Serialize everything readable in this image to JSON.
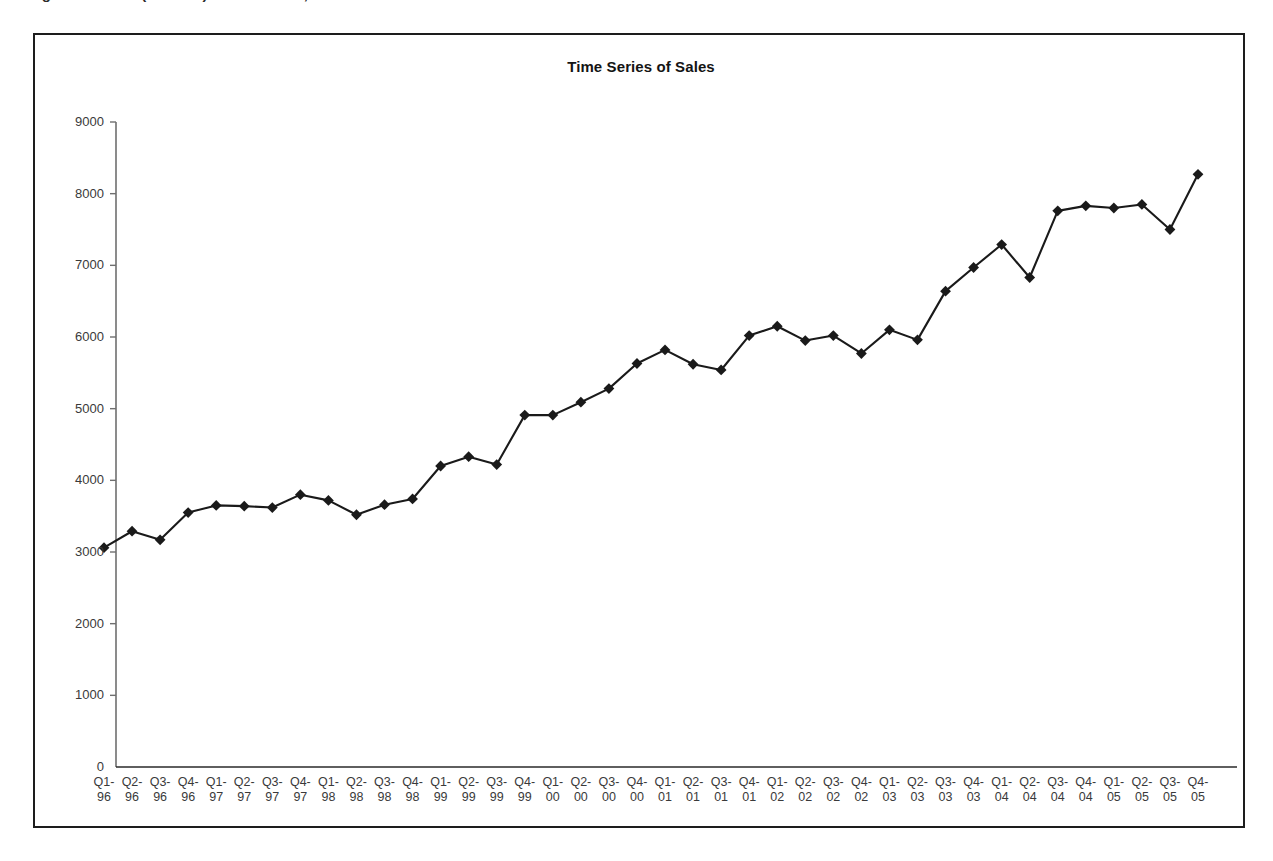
{
  "caption": {
    "text": "Figure 1. Sales (in 000’s) of Product X, Annual Sales",
    "visible_fragment": "partially cropped heading above figure"
  },
  "figure": {
    "border_color": "#1d1d1d"
  },
  "chart_data": {
    "type": "line",
    "title": "Time Series of Sales",
    "xlabel": "",
    "ylabel": "",
    "ylim": [
      0,
      9000
    ],
    "ytick_step": 1000,
    "yticks": [
      0,
      1000,
      2000,
      3000,
      4000,
      5000,
      6000,
      7000,
      8000,
      9000
    ],
    "grid": false,
    "legend": false,
    "marker": "diamond",
    "line_color": "#1a1a1a",
    "marker_color": "#1a1a1a",
    "categories": [
      "Q1-96",
      "Q2-96",
      "Q3-96",
      "Q4-96",
      "Q1-97",
      "Q2-97",
      "Q3-97",
      "Q4-97",
      "Q1-98",
      "Q2-98",
      "Q3-98",
      "Q4-98",
      "Q1-99",
      "Q2-99",
      "Q3-99",
      "Q4-99",
      "Q1-00",
      "Q2-00",
      "Q3-00",
      "Q4-00",
      "Q1-01",
      "Q2-01",
      "Q3-01",
      "Q4-01",
      "Q1-02",
      "Q2-02",
      "Q3-02",
      "Q4-02",
      "Q1-03",
      "Q2-03",
      "Q3-03",
      "Q4-03",
      "Q1-04",
      "Q2-04",
      "Q3-04",
      "Q4-04",
      "Q1-05",
      "Q2-05",
      "Q3-05",
      "Q4-05"
    ],
    "category_lines": [
      [
        "Q1-",
        "96"
      ],
      [
        "Q2-",
        "96"
      ],
      [
        "Q3-",
        "96"
      ],
      [
        "Q4-",
        "96"
      ],
      [
        "Q1-",
        "97"
      ],
      [
        "Q2-",
        "97"
      ],
      [
        "Q3-",
        "97"
      ],
      [
        "Q4-",
        "97"
      ],
      [
        "Q1-",
        "98"
      ],
      [
        "Q2-",
        "98"
      ],
      [
        "Q3-",
        "98"
      ],
      [
        "Q4-",
        "98"
      ],
      [
        "Q1-",
        "99"
      ],
      [
        "Q2-",
        "99"
      ],
      [
        "Q3-",
        "99"
      ],
      [
        "Q4-",
        "99"
      ],
      [
        "Q1-",
        "00"
      ],
      [
        "Q2-",
        "00"
      ],
      [
        "Q3-",
        "00"
      ],
      [
        "Q4-",
        "00"
      ],
      [
        "Q1-",
        "01"
      ],
      [
        "Q2-",
        "01"
      ],
      [
        "Q3-",
        "01"
      ],
      [
        "Q4-",
        "01"
      ],
      [
        "Q1-",
        "02"
      ],
      [
        "Q2-",
        "02"
      ],
      [
        "Q3-",
        "02"
      ],
      [
        "Q4-",
        "02"
      ],
      [
        "Q1-",
        "03"
      ],
      [
        "Q2-",
        "03"
      ],
      [
        "Q3-",
        "03"
      ],
      [
        "Q4-",
        "03"
      ],
      [
        "Q1-",
        "04"
      ],
      [
        "Q2-",
        "04"
      ],
      [
        "Q3-",
        "04"
      ],
      [
        "Q4-",
        "04"
      ],
      [
        "Q1-",
        "05"
      ],
      [
        "Q2-",
        "05"
      ],
      [
        "Q3-",
        "05"
      ],
      [
        "Q4-",
        "05"
      ]
    ],
    "values": [
      3060,
      3290,
      3170,
      3550,
      3650,
      3640,
      3620,
      3800,
      3720,
      3520,
      3660,
      3740,
      4200,
      4330,
      4220,
      4910,
      4910,
      5090,
      5280,
      5630,
      5820,
      5620,
      5540,
      6020,
      6150,
      5950,
      6020,
      5770,
      6100,
      5960,
      6640,
      6970,
      7290,
      6830,
      7760,
      7830,
      7800,
      7850,
      7500,
      8270
    ],
    "series": [
      {
        "name": "Sales",
        "values": [
          3060,
          3290,
          3170,
          3550,
          3650,
          3640,
          3620,
          3800,
          3720,
          3520,
          3660,
          3740,
          4200,
          4330,
          4220,
          4910,
          4910,
          5090,
          5280,
          5630,
          5820,
          5620,
          5540,
          6020,
          6150,
          5950,
          6020,
          5770,
          6100,
          5960,
          6640,
          6970,
          7290,
          6830,
          7760,
          7830,
          7800,
          7850,
          7500,
          8270
        ]
      }
    ]
  }
}
